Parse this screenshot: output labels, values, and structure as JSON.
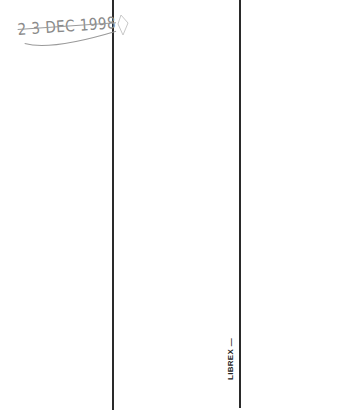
{
  "document": {
    "date_stamp": "2 3 DEC 1998",
    "vertical_label": "LIBREX —",
    "colors": {
      "line": "#2a2a2a",
      "stamp": "#8a8a8a",
      "label": "#222222",
      "background": "#ffffff"
    }
  }
}
